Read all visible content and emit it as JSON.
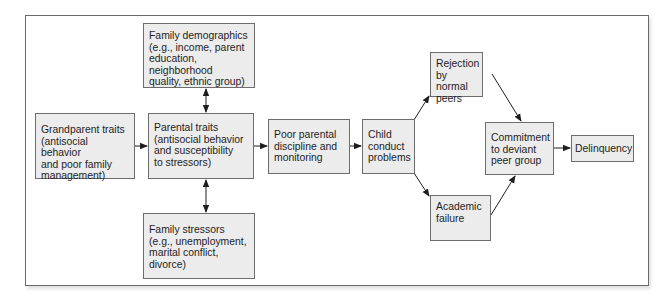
{
  "diagram": {
    "type": "flow-diagram",
    "colors": {
      "box_fill": "#ececec",
      "box_border": "#6d6d6d",
      "arrow": "#1e1e1e",
      "frame_border": "#6a6a6a",
      "background": "#ffffff"
    },
    "nodes": [
      {
        "id": "family-demographics",
        "label": "Family demographics\n(e.g., income, parent\neducation,\nneighborhood\nquality, ethnic group)"
      },
      {
        "id": "grandparent-traits",
        "label": "Grandparent traits\n(antisocial behavior\nand poor family\nmanagement)"
      },
      {
        "id": "parental-traits",
        "label": "Parental traits\n(antisocial behavior\nand susceptibility\nto stressors)"
      },
      {
        "id": "poor-parental-discipline",
        "label": "Poor parental\ndiscipline and\nmonitoring"
      },
      {
        "id": "child-conduct-problems",
        "label": "Child\nconduct\nproblems"
      },
      {
        "id": "rejection-by-peers",
        "label": "Rejection\nby normal\npeers"
      },
      {
        "id": "academic-failure",
        "label": "Academic\nfailure"
      },
      {
        "id": "commitment-deviant-peers",
        "label": "Commitment\nto deviant\npeer group"
      },
      {
        "id": "delinquency",
        "label": "Delinquency"
      },
      {
        "id": "family-stressors",
        "label": "Family stressors\n(e.g., unemployment,\nmarital conflict,\ndivorce)"
      }
    ],
    "edges": [
      {
        "from": "family-demographics",
        "to": "parental-traits",
        "direction": "bidirectional"
      },
      {
        "from": "family-stressors",
        "to": "parental-traits",
        "direction": "bidirectional"
      },
      {
        "from": "grandparent-traits",
        "to": "parental-traits",
        "direction": "forward"
      },
      {
        "from": "parental-traits",
        "to": "poor-parental-discipline",
        "direction": "forward"
      },
      {
        "from": "poor-parental-discipline",
        "to": "child-conduct-problems",
        "direction": "forward"
      },
      {
        "from": "child-conduct-problems",
        "to": "rejection-by-peers",
        "direction": "forward"
      },
      {
        "from": "child-conduct-problems",
        "to": "academic-failure",
        "direction": "forward"
      },
      {
        "from": "rejection-by-peers",
        "to": "commitment-deviant-peers",
        "direction": "forward"
      },
      {
        "from": "academic-failure",
        "to": "commitment-deviant-peers",
        "direction": "forward"
      },
      {
        "from": "commitment-deviant-peers",
        "to": "delinquency",
        "direction": "forward"
      }
    ]
  }
}
